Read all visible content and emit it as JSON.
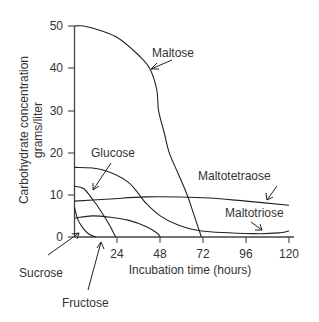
{
  "chart_data": {
    "type": "line",
    "title": "",
    "xlabel": "Incubation time (hours)",
    "ylabel_lines": [
      "Carbohydrate concentration",
      "grams/liter"
    ],
    "ylabel": "Carbohydrate concentration grams/liter",
    "xlim": [
      0,
      120
    ],
    "ylim": [
      0,
      50
    ],
    "x_ticks": [
      24,
      48,
      72,
      96,
      120
    ],
    "y_ticks": [
      0,
      10,
      20,
      30,
      40,
      50
    ],
    "grid": false,
    "legend": "inline labels with arrows",
    "series": [
      {
        "name": "Maltose",
        "x": [
          0,
          5,
          14,
          25,
          36,
          42,
          46,
          47,
          50,
          53,
          58,
          63,
          67,
          71
        ],
        "y": [
          50,
          50,
          49,
          47,
          43,
          40,
          35,
          30,
          25,
          20,
          15,
          10,
          5,
          0
        ]
      },
      {
        "name": "Maltotriose",
        "x": [
          0,
          15,
          30,
          40,
          48,
          57,
          70,
          100,
          115,
          120
        ],
        "y": [
          16.5,
          16,
          13,
          8,
          5,
          3,
          1.5,
          0.8,
          1,
          1.5
        ]
      },
      {
        "name": "Glucose",
        "x": [
          0,
          5,
          10,
          15,
          20,
          23
        ],
        "y": [
          12,
          11.5,
          9,
          6,
          2.5,
          0
        ]
      },
      {
        "name": "Maltotetraose",
        "x": [
          0,
          20,
          40,
          72,
          96,
          120
        ],
        "y": [
          8.5,
          9,
          9.5,
          9.3,
          8.5,
          7.5
        ]
      },
      {
        "name": "Fructose",
        "x": [
          0,
          10,
          20,
          30,
          40,
          46,
          48
        ],
        "y": [
          4.5,
          5,
          4.7,
          4,
          2.5,
          1,
          0
        ]
      },
      {
        "name": "Sucrose",
        "x": [
          0,
          2,
          5,
          8,
          12
        ],
        "y": [
          7,
          4,
          2,
          0.7,
          0
        ]
      }
    ],
    "annotations": [
      {
        "text": "Maltose",
        "points_to": "Maltose"
      },
      {
        "text": "Glucose",
        "points_to": "Glucose"
      },
      {
        "text": "Maltotetraose",
        "points_to": "Maltotetraose"
      },
      {
        "text": "Maltotriose",
        "points_to": "Maltotriose"
      },
      {
        "text": "Sucrose",
        "points_to": "Sucrose"
      },
      {
        "text": "Fructose",
        "points_to": "Fructose"
      }
    ]
  },
  "labels": {
    "maltose": "Maltose",
    "glucose": "Glucose",
    "maltotetraose": "Maltotetraose",
    "maltotriose": "Maltotriose",
    "sucrose": "Sucrose",
    "fructose": "Fructose"
  },
  "axes": {
    "xlabel": "Incubation time (hours)",
    "ylabel_line1": "Carbohydrate concentration",
    "ylabel_line2": "grams/liter",
    "x_tick_labels": [
      "24",
      "48",
      "72",
      "96",
      "120"
    ],
    "y_tick_labels": [
      "0",
      "10",
      "20",
      "30",
      "40",
      "50"
    ]
  }
}
